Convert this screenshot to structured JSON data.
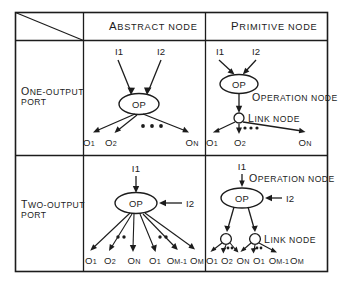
{
  "figure": {
    "corner_cell": {
      "diagonal": true,
      "label": ""
    },
    "column_headers": [
      {
        "id": "abstract",
        "first": "A",
        "rest": "BSTRACT NODE",
        "full": "ABSTRACT NODE"
      },
      {
        "id": "primitive",
        "first": "P",
        "rest": "RIMITIVE NODE",
        "full": "PRIMITIVE NODE"
      }
    ],
    "row_headers": [
      {
        "id": "one-output",
        "line1_first": "O",
        "line1_rest": "NE-OUTPUT",
        "line2": "PORT",
        "full": "ONE-OUTPUT PORT"
      },
      {
        "id": "two-output",
        "line1_first": "T",
        "line1_rest": "WO-OUTPUT",
        "line2": "PORT",
        "full": "TWO-OUTPUT PORT"
      }
    ],
    "annotations": {
      "operation_node": {
        "first": "O",
        "rest": "PERATION NODE",
        "full": "OPERATION NODE"
      },
      "link_node": {
        "first": "L",
        "rest": "INK NODE",
        "full": "LINK NODE"
      }
    },
    "node_labels": {
      "op": "OP"
    },
    "cells": [
      {
        "id": "one-output-abstract",
        "row": "one-output",
        "column": "abstract",
        "inputs": [
          {
            "label": "I1",
            "base": "I1",
            "sub": "",
            "direction": "down-right"
          },
          {
            "label": "I2",
            "base": "I2",
            "sub": "",
            "direction": "down-left"
          }
        ],
        "nodes": [
          {
            "type": "operation",
            "label": "OP"
          }
        ],
        "ellipsis_groups": 1,
        "outputs": [
          {
            "base": "O",
            "sub": "1",
            "label": "O1"
          },
          {
            "base": "O",
            "sub": "2",
            "label": "O2"
          },
          {
            "base": "O",
            "sub": "N",
            "label": "ON"
          }
        ],
        "annotation_labels": []
      },
      {
        "id": "one-output-primitive",
        "row": "one-output",
        "column": "primitive",
        "inputs": [
          {
            "label": "I1",
            "base": "I1",
            "sub": "",
            "direction": "down-right"
          },
          {
            "label": "I2",
            "base": "I2",
            "sub": "",
            "direction": "down-left"
          }
        ],
        "nodes": [
          {
            "type": "operation",
            "label": "OP"
          },
          {
            "type": "link",
            "label": ""
          }
        ],
        "ellipsis_groups": 1,
        "outputs": [
          {
            "base": "O",
            "sub": "1",
            "label": "O1"
          },
          {
            "base": "O",
            "sub": "2",
            "label": "O2"
          },
          {
            "base": "O",
            "sub": "N",
            "label": "ON"
          }
        ],
        "annotation_labels": [
          "OPERATION NODE",
          "LINK NODE"
        ]
      },
      {
        "id": "two-output-abstract",
        "row": "two-output",
        "column": "abstract",
        "inputs": [
          {
            "label": "I1",
            "base": "I1",
            "sub": "",
            "direction": "down"
          },
          {
            "label": "I2",
            "base": "I2",
            "sub": "",
            "direction": "left"
          }
        ],
        "nodes": [
          {
            "type": "operation",
            "label": "OP"
          }
        ],
        "ellipsis_groups": 2,
        "outputs": [
          {
            "base": "O",
            "sub": "1",
            "label": "O1"
          },
          {
            "base": "O",
            "sub": "2",
            "label": "O2"
          },
          {
            "base": "O",
            "sub": "N",
            "label": "ON"
          },
          {
            "base": "O",
            "sub": "1",
            "label": "O1"
          },
          {
            "base": "O",
            "sub": "M-1",
            "label": "OM-1"
          },
          {
            "base": "O",
            "sub": "M",
            "label": "OM"
          }
        ],
        "annotation_labels": []
      },
      {
        "id": "two-output-primitive",
        "row": "two-output",
        "column": "primitive",
        "inputs": [
          {
            "label": "I1",
            "base": "I1",
            "sub": "",
            "direction": "down"
          },
          {
            "label": "I2",
            "base": "I2",
            "sub": "",
            "direction": "left"
          }
        ],
        "nodes": [
          {
            "type": "operation",
            "label": "OP"
          },
          {
            "type": "link",
            "label": ""
          },
          {
            "type": "link",
            "label": ""
          }
        ],
        "ellipsis_groups": 2,
        "outputs": [
          {
            "base": "O",
            "sub": "1",
            "label": "O1"
          },
          {
            "base": "O",
            "sub": "2",
            "label": "O2"
          },
          {
            "base": "O",
            "sub": "N",
            "label": "ON"
          },
          {
            "base": "O",
            "sub": "1",
            "label": "O1"
          },
          {
            "base": "O",
            "sub": "M-1",
            "label": "OM-1"
          },
          {
            "base": "O",
            "sub": "M",
            "label": "OM"
          }
        ],
        "annotation_labels": [
          "OPERATION NODE",
          "LINK NODE"
        ]
      }
    ],
    "colors": {
      "background": "#ffffff",
      "ink": "#1c1c1c",
      "node_fill": "#ffffff"
    }
  }
}
